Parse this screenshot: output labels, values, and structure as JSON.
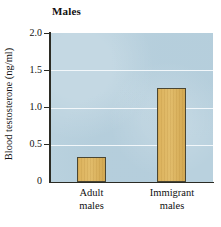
{
  "chart_data": {
    "type": "bar",
    "title": "Males",
    "xlabel": "",
    "ylabel": "Blood testosterone (ng/ml)",
    "categories": [
      "Adult males",
      "Immigrant males"
    ],
    "category_lines": [
      [
        "Adult",
        "males"
      ],
      [
        "Immigrant",
        "males"
      ]
    ],
    "values": [
      0.34,
      1.26
    ],
    "ylim": [
      0,
      2.0
    ],
    "yticks": [
      0,
      0.5,
      1.0,
      1.5,
      2.0
    ],
    "ytick_labels": [
      "0",
      "0.5",
      "1.0",
      "1.5",
      "2.0"
    ],
    "grid": true,
    "gridlines_at": [
      0.5,
      1.0,
      1.5
    ],
    "legend": null,
    "legend_position": "none",
    "colors": {
      "plot_background": "#b9d1de",
      "bar_fill": "#dcb25c",
      "bar_border": "#4a4633",
      "gridline": "#f2f7fa",
      "axis": "#2b2b24",
      "text": "#111111",
      "page_background": "#ffffff"
    }
  }
}
